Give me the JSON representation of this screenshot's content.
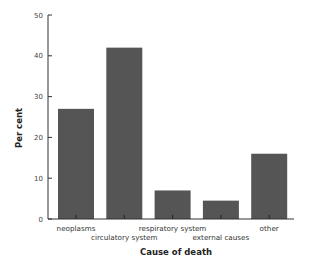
{
  "chart_data": {
    "type": "bar",
    "title": "",
    "xlabel": "Cause of death",
    "ylabel": "Per cent",
    "categories": [
      "neoplasms",
      "circulatory system",
      "respiratory system",
      "external causes",
      "other"
    ],
    "values": [
      27,
      42,
      7,
      4.5,
      16
    ],
    "ylim": [
      0,
      50
    ],
    "yticks": [
      0,
      10,
      20,
      30,
      40,
      50
    ],
    "grid": false,
    "legend": null,
    "bar_color": "#555555",
    "label_rows": [
      0,
      1,
      0,
      1,
      0
    ]
  }
}
